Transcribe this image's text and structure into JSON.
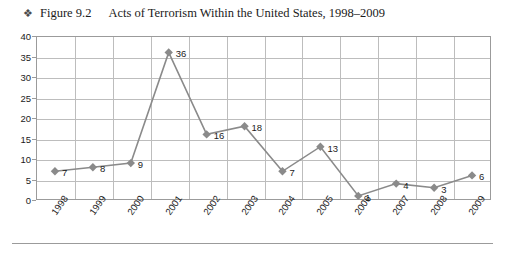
{
  "caption": {
    "bullet_icon": "floral-diamond-bullet",
    "bullet_glyph": "❖",
    "figure_number": "Figure 9.2",
    "title": "Acts of Terrorism Within the United States, 1998–2009"
  },
  "colors": {
    "series": "#8a8a8a",
    "marker": "#8a8a8a",
    "grid": "#bdbdbd",
    "frame": "#9b9b9b",
    "text": "#1b1b1b"
  },
  "chart_data": {
    "type": "line",
    "title": "Acts of Terrorism Within the United States, 1998–2009",
    "xlabel": "",
    "ylabel": "",
    "categories": [
      "1998",
      "1999",
      "2000",
      "2001",
      "2002",
      "2003",
      "2004",
      "2005",
      "2006",
      "2007",
      "2008",
      "2009"
    ],
    "values": [
      7,
      8,
      9,
      36,
      16,
      18,
      7,
      13,
      1,
      4,
      3,
      6
    ],
    "data_labels": [
      "7",
      "8",
      "9",
      "36",
      "16",
      "18",
      "7",
      "13",
      "1",
      "4",
      "3",
      "6"
    ],
    "ylim": [
      0,
      40
    ],
    "yticks": [
      0,
      5,
      10,
      15,
      20,
      25,
      30,
      35,
      40
    ],
    "ytick_labels": [
      "0",
      "5",
      "10",
      "15",
      "20",
      "25",
      "30",
      "35",
      "40"
    ],
    "grid": true,
    "grid_axes": "both",
    "legend": false,
    "marker": "diamond",
    "series_name": "Acts of Terrorism"
  }
}
